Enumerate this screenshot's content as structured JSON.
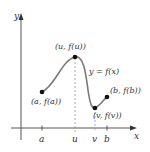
{
  "diagram": {
    "axes": {
      "x_label": "x",
      "y_label": "y"
    },
    "curve_label": "y = f(x)",
    "points": [
      {
        "id": "a",
        "label": "(a, f(a))"
      },
      {
        "id": "u",
        "label": "(u, f(u))"
      },
      {
        "id": "v",
        "label": "(v, f(v))"
      },
      {
        "id": "b",
        "label": "(b, f(b))"
      }
    ],
    "ticks": [
      "a",
      "u",
      "v",
      "b"
    ],
    "colors": {
      "curve": "#7a7a7a",
      "axis": "#555555",
      "point": "#111111",
      "dashed": "#999999",
      "text": "#333333"
    }
  }
}
